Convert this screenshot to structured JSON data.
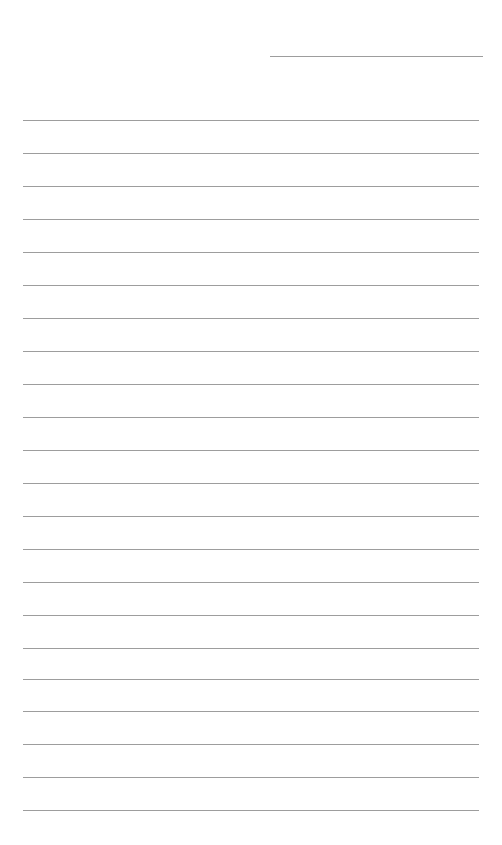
{
  "page": {
    "type": "lined-paper",
    "background_color": "#ffffff",
    "line_color": "#9d9d9d",
    "header_line": {
      "label": "",
      "x": 270,
      "y": 56,
      "width": 213
    },
    "rules": {
      "count": 22,
      "first_y": 120,
      "spacing": 33,
      "x": 23,
      "width": 456
    },
    "lines": [
      {
        "y": 120
      },
      {
        "y": 153
      },
      {
        "y": 186
      },
      {
        "y": 219
      },
      {
        "y": 252
      },
      {
        "y": 285
      },
      {
        "y": 318
      },
      {
        "y": 351
      },
      {
        "y": 384
      },
      {
        "y": 417
      },
      {
        "y": 450
      },
      {
        "y": 483
      },
      {
        "y": 516
      },
      {
        "y": 549
      },
      {
        "y": 582
      },
      {
        "y": 615
      },
      {
        "y": 648
      },
      {
        "y": 679
      },
      {
        "y": 711
      },
      {
        "y": 744
      },
      {
        "y": 777
      },
      {
        "y": 810
      }
    ]
  }
}
